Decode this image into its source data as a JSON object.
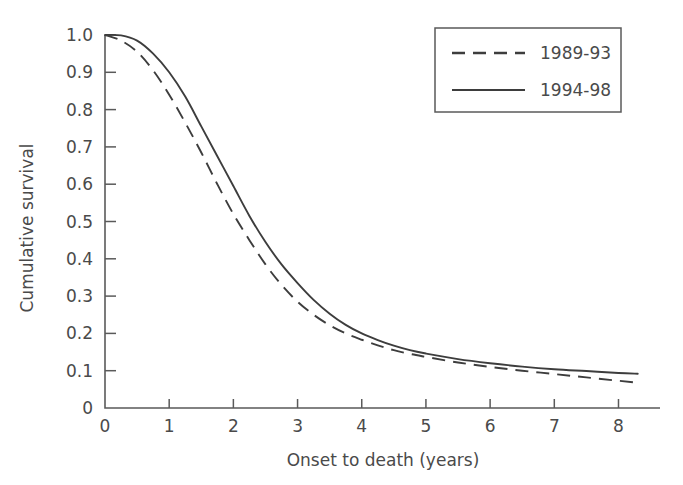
{
  "chart_data": {
    "type": "line",
    "title": "",
    "xlabel": "Onset to death (years)",
    "ylabel": "Cumulative survival",
    "xlim": [
      0,
      8.6
    ],
    "ylim": [
      0,
      1.0
    ],
    "grid": false,
    "legend_position": "top-right",
    "xticks": [
      "0",
      "1",
      "2",
      "3",
      "4",
      "5",
      "6",
      "7",
      "8"
    ],
    "xtick_values": [
      0,
      1,
      2,
      3,
      4,
      5,
      6,
      7,
      8
    ],
    "yticks": [
      "0",
      "0.1",
      "0.2",
      "0.3",
      "0.4",
      "0.5",
      "0.6",
      "0.7",
      "0.8",
      "0.9",
      "1.0"
    ],
    "ytick_values": [
      0,
      0.1,
      0.2,
      0.3,
      0.4,
      0.5,
      0.6,
      0.7,
      0.8,
      0.9,
      1.0
    ],
    "x": [
      0,
      0.25,
      0.5,
      0.75,
      1.0,
      1.25,
      1.5,
      1.75,
      2.0,
      2.25,
      2.5,
      2.75,
      3.0,
      3.25,
      3.5,
      3.75,
      4.0,
      4.25,
      4.5,
      4.75,
      5.0,
      5.5,
      6.0,
      6.5,
      7.0,
      7.5,
      8.0,
      8.3
    ],
    "series": [
      {
        "name": "1989-93",
        "style": "dashed",
        "color": "#3d3d3d",
        "values": [
          1.0,
          0.985,
          0.955,
          0.905,
          0.84,
          0.765,
          0.685,
          0.6,
          0.52,
          0.45,
          0.385,
          0.33,
          0.285,
          0.25,
          0.222,
          0.2,
          0.183,
          0.168,
          0.155,
          0.145,
          0.137,
          0.122,
          0.11,
          0.1,
          0.091,
          0.082,
          0.073,
          0.068
        ]
      },
      {
        "name": "1994-98",
        "style": "solid",
        "color": "#3d3d3d",
        "values": [
          1.0,
          0.999,
          0.985,
          0.95,
          0.9,
          0.835,
          0.755,
          0.675,
          0.595,
          0.515,
          0.445,
          0.385,
          0.335,
          0.29,
          0.253,
          0.223,
          0.2,
          0.182,
          0.167,
          0.155,
          0.146,
          0.131,
          0.12,
          0.111,
          0.104,
          0.099,
          0.094,
          0.092
        ]
      }
    ],
    "legend_entries": [
      {
        "label": "1989-93",
        "style": "dashed"
      },
      {
        "label": "1994-98",
        "style": "solid"
      }
    ]
  }
}
